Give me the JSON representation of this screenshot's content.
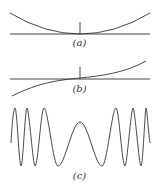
{
  "panels": [
    {
      "id": "a",
      "label": "(a)",
      "description": "parabola-like curve touching horizontal axis at center tick"
    },
    {
      "id": "b",
      "label": "(b)",
      "description": "odd S-shaped curve crossing axis at center tick"
    },
    {
      "id": "c",
      "label": "(c)",
      "description": "oscillating wave with frequency decreasing toward center (chirp-like)"
    }
  ],
  "colors": {
    "line": "#333333",
    "background": "#ffffff"
  }
}
